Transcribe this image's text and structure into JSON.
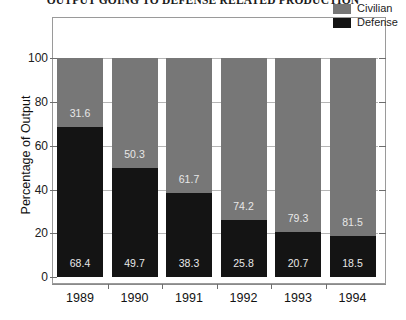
{
  "chart_data": {
    "type": "bar",
    "subtype": "stacked-percentage-column",
    "title": "OUTPUT GOING TO DEFENSE RELATED PRODUCTION",
    "xlabel": "",
    "ylabel": "Percentage of Output",
    "categories": [
      "1989",
      "1990",
      "1991",
      "1992",
      "1993",
      "1994"
    ],
    "ylim": [
      0,
      100
    ],
    "yticks": [
      0,
      20,
      40,
      60,
      80,
      100
    ],
    "ytick_labels": [
      "0",
      "20",
      "40",
      "60",
      "80",
      "100"
    ],
    "grid": true,
    "legend_position": "top-right",
    "series": [
      {
        "name": "Civilian",
        "color": "#777777",
        "values": [
          31.6,
          50.3,
          61.7,
          74.2,
          79.3,
          81.5
        ],
        "labels": [
          "31.6",
          "50.3",
          "61.7",
          "74.2",
          "79.3",
          "81.5"
        ]
      },
      {
        "name": "Defense",
        "color": "#141414",
        "values": [
          68.4,
          49.7,
          38.3,
          25.8,
          20.7,
          18.5
        ],
        "labels": [
          "68.4",
          "49.7",
          "38.3",
          "25.8",
          "20.7",
          "18.5"
        ]
      }
    ]
  },
  "legend": {
    "items": [
      {
        "label": "Civilian",
        "color": "#777777"
      },
      {
        "label": "Defense",
        "color": "#141414"
      }
    ]
  },
  "axes": {
    "y_title": "Percentage of Output",
    "y_labels": [
      "100",
      "80",
      "60",
      "40",
      "20",
      "0"
    ],
    "x_labels": [
      "1989",
      "1990",
      "1991",
      "1992",
      "1993",
      "1994"
    ]
  }
}
